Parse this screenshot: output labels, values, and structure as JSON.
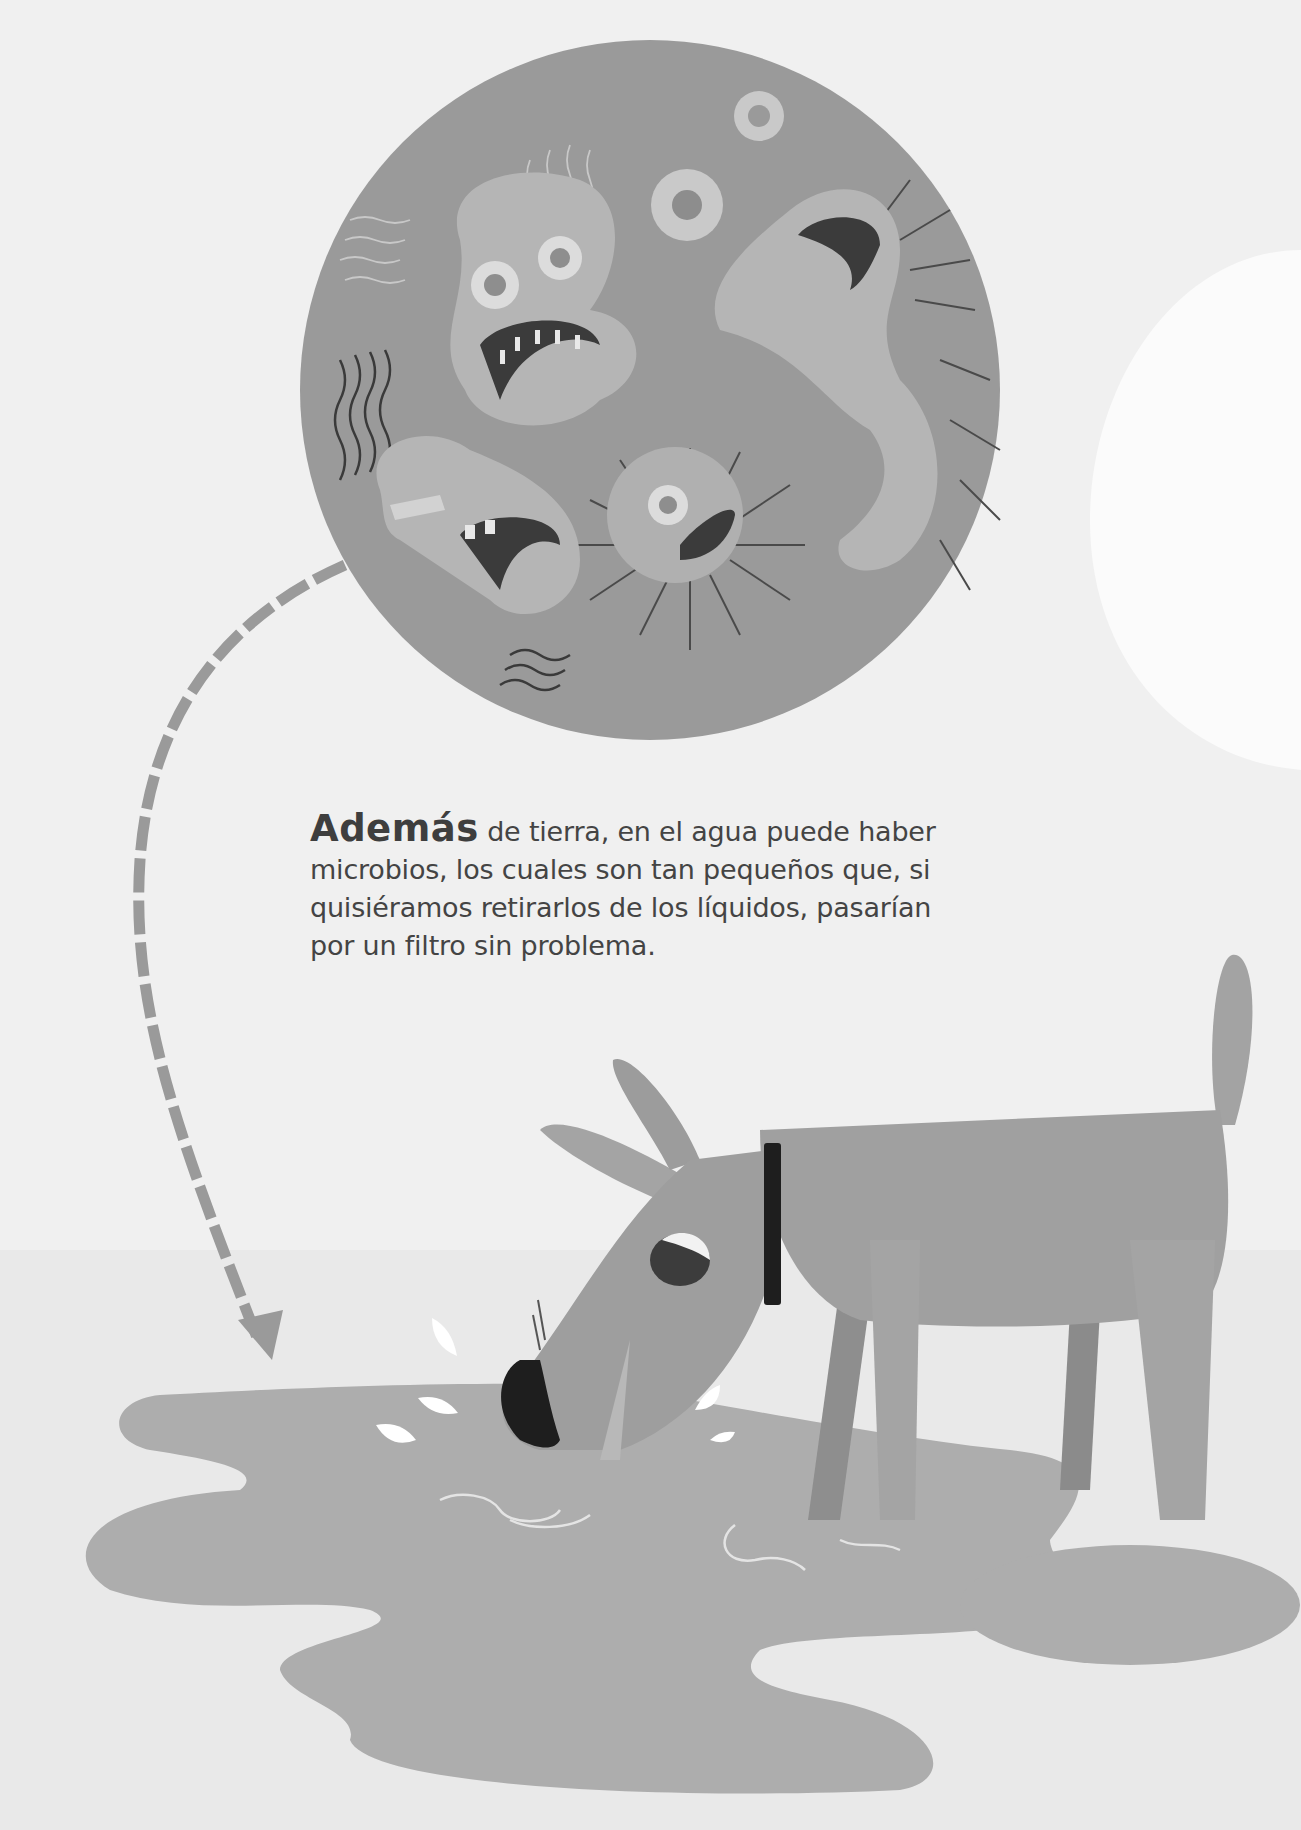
{
  "page": {
    "type": "illustrated book page",
    "palette": {
      "background": "#f0f0f0",
      "microbe_circle": "#9a9a9a",
      "microbe_body": "#b3b3b3",
      "dog_body": "#9b9b9b",
      "puddle": "#adadad",
      "text": "#444444",
      "collar": "#1e1e1e",
      "arrow": "#999999"
    }
  },
  "text": {
    "lead_word": "Además",
    "line1_rest": " de tierra, en el agua puede haber",
    "line2": "microbios, los cuales son tan pequeños que, si",
    "line3": "quisiéramos retirarlos de los líquidos, pasarían",
    "line4": "por un filtro sin problema."
  },
  "illustration": {
    "microbe_circle": {
      "description": "magnified circle with screaming microbes"
    },
    "arrow": {
      "description": "dashed curved arrow from circle down to puddle"
    },
    "dog": {
      "description": "grey dog drinking from a puddle, black collar"
    },
    "puddle": {
      "description": "water puddle with splashes and ripples"
    }
  }
}
